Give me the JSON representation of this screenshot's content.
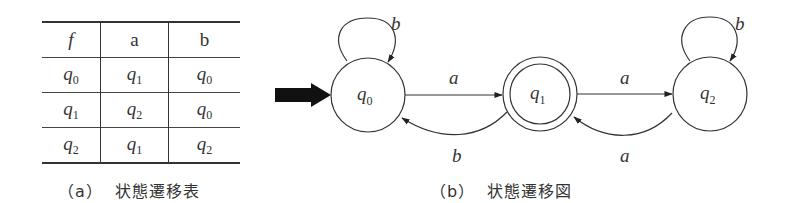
{
  "table": {
    "header": [
      "f",
      "a",
      "b"
    ],
    "rows": [
      {
        "state": {
          "base": "q",
          "sub": "0"
        },
        "a": {
          "base": "q",
          "sub": "1"
        },
        "b": {
          "base": "q",
          "sub": "0"
        }
      },
      {
        "state": {
          "base": "q",
          "sub": "1"
        },
        "a": {
          "base": "q",
          "sub": "2"
        },
        "b": {
          "base": "q",
          "sub": "0"
        }
      },
      {
        "state": {
          "base": "q",
          "sub": "2"
        },
        "a": {
          "base": "q",
          "sub": "1"
        },
        "b": {
          "base": "q",
          "sub": "2"
        }
      }
    ],
    "caption": "（a）  状態遷移表"
  },
  "diagram": {
    "caption": "（b）  状態遷移図",
    "start_state": "q0",
    "accepting_states": [
      "q1"
    ],
    "states": [
      {
        "id": "q0",
        "base": "q",
        "sub": "0"
      },
      {
        "id": "q1",
        "base": "q",
        "sub": "1"
      },
      {
        "id": "q2",
        "base": "q",
        "sub": "2"
      }
    ],
    "edges": [
      {
        "from": "q0",
        "to": "q0",
        "label": "b"
      },
      {
        "from": "q0",
        "to": "q1",
        "label": "a"
      },
      {
        "from": "q1",
        "to": "q0",
        "label": "b"
      },
      {
        "from": "q1",
        "to": "q2",
        "label": "a"
      },
      {
        "from": "q2",
        "to": "q1",
        "label": "a"
      },
      {
        "from": "q2",
        "to": "q2",
        "label": "b"
      }
    ]
  }
}
